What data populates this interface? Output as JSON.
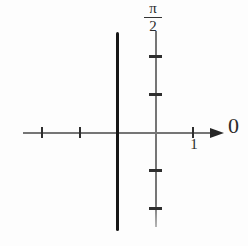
{
  "labels": {
    "y_axis_top": {
      "numerator": "π",
      "denominator": "2"
    },
    "x_arrow": "0",
    "x_unit_tick": "1"
  },
  "colors": {
    "background": "#fdfdfd",
    "axis": "#757575",
    "tick": "#2e2e2e",
    "arrow": "#262626",
    "curve": "#161616",
    "text": "#2b2b2b"
  },
  "chart_data": {
    "type": "line",
    "title": "",
    "xlabel": "0",
    "ylabel": "π/2",
    "grid": false,
    "legend": false,
    "x_axis": {
      "arrow_direction": "right",
      "arrow_label": "0",
      "visible_ticks": [
        -3,
        -2,
        1
      ],
      "labeled_tick": {
        "value": 1,
        "label": "1"
      },
      "range_estimate": [
        -3.5,
        1.8
      ]
    },
    "y_axis": {
      "top_label": "π/2",
      "visible_ticks": [
        2,
        1,
        -1,
        -2
      ],
      "range_estimate": [
        -2.7,
        2.7
      ]
    },
    "series": [
      {
        "name": "thick-vertical-line",
        "shape": "vline",
        "style": "thick solid black",
        "x": -1,
        "y_span_estimate": [
          -2.6,
          2.65
        ]
      }
    ]
  }
}
